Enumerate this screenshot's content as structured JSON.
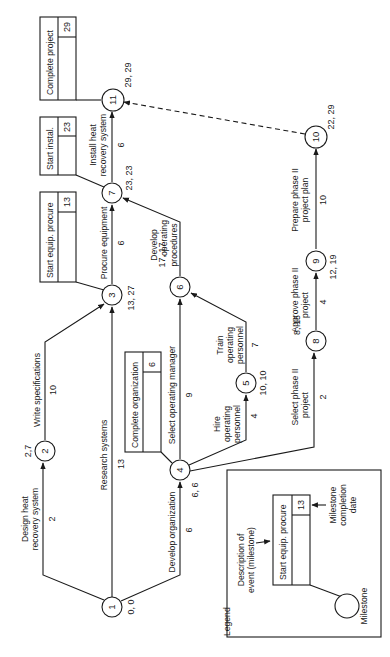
{
  "diagram": {
    "type": "pert-network",
    "orientation": "rotated-90-ccw",
    "nodes": [
      {
        "id": "1",
        "label": "1",
        "times": "0, 0"
      },
      {
        "id": "2",
        "label": "2",
        "times": "2,7"
      },
      {
        "id": "3",
        "label": "3",
        "times": "13, 27"
      },
      {
        "id": "4",
        "label": "4",
        "times": "6, 6"
      },
      {
        "id": "5",
        "label": "5",
        "times": "10, 10"
      },
      {
        "id": "6",
        "label": "6",
        "times": "17, 17"
      },
      {
        "id": "7",
        "label": "7",
        "times": "23, 23"
      },
      {
        "id": "8",
        "label": "8",
        "times": "8, 15"
      },
      {
        "id": "9",
        "label": "9",
        "times": "12, 19"
      },
      {
        "id": "10",
        "label": "10",
        "times": "22, 29"
      },
      {
        "id": "11",
        "label": "11",
        "times": "29, 29"
      }
    ],
    "activities": [
      {
        "from": "1",
        "to": "2",
        "line1": "Design heat",
        "line2": "recovery system",
        "duration": "2"
      },
      {
        "from": "2",
        "to": "3",
        "line1": "Write specifications",
        "line2": "",
        "duration": "10"
      },
      {
        "from": "1",
        "to": "3",
        "line1": "Research systems",
        "line2": "",
        "duration": "13"
      },
      {
        "from": "1",
        "to": "4",
        "line1": "Develop organization",
        "line2": "",
        "duration": "6"
      },
      {
        "from": "3",
        "to": "7",
        "line1": "Procure equipment",
        "line2": "",
        "duration": "6"
      },
      {
        "from": "4",
        "to": "6",
        "line1": "Select operating manager",
        "line2": "",
        "duration": "9"
      },
      {
        "from": "4",
        "to": "5",
        "line1": "Hire",
        "line2": "operating",
        "line3": "personnel",
        "duration": "4"
      },
      {
        "from": "5",
        "to": "6",
        "line1": "Train",
        "line2": "operating",
        "line3": "personnel",
        "duration": "7"
      },
      {
        "from": "6",
        "to": "7",
        "line1": "Develop",
        "line2": "operating",
        "line3": "procedures",
        "duration": ""
      },
      {
        "from": "7",
        "to": "11",
        "line1": "Install heat",
        "line2": "recovery system",
        "duration": "6"
      },
      {
        "from": "4",
        "to": "8",
        "line1": "Select phase II",
        "line2": "project",
        "duration": "2"
      },
      {
        "from": "8",
        "to": "9",
        "line1": "Approve phase II",
        "line2": "project",
        "duration": "4"
      },
      {
        "from": "9",
        "to": "10",
        "line1": "Prepare phase II",
        "line2": "project plan",
        "duration": "10"
      },
      {
        "from": "10",
        "to": "11",
        "line1": "",
        "line2": "",
        "duration": "",
        "style": "dashed"
      }
    ],
    "milestones": [
      {
        "node": "11",
        "description": "Complete project",
        "date": "29"
      },
      {
        "node": "7",
        "description": "Start instal.",
        "date": "23"
      },
      {
        "node": "3",
        "description": "Start equip. procure",
        "date": "13"
      },
      {
        "node": "4",
        "description": "Complete organization",
        "date": "6"
      }
    ],
    "legend": {
      "title": "Legend",
      "box_description": "Start equip. procure",
      "box_date": "13",
      "desc_label_1": "Description of",
      "desc_label_2": "event (milestone)",
      "date_label_1": "Milestone",
      "date_label_2": "completion",
      "date_label_3": "date",
      "circle_label": "Milestone"
    }
  }
}
